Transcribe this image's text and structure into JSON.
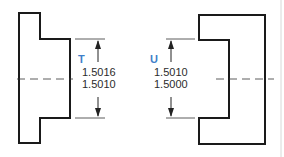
{
  "diagram": {
    "parts": [
      {
        "id": "T",
        "label": "T",
        "dimension_upper": "1.5016",
        "dimension_lower": "1.5010"
      },
      {
        "id": "U",
        "label": "U",
        "dimension_upper": "1.5010",
        "dimension_lower": "1.5000"
      }
    ],
    "colors": {
      "outline": "#1a1a1a",
      "label_accent": "#3f7fc9",
      "text": "#2b2b2b",
      "background": "#ffffff"
    }
  }
}
